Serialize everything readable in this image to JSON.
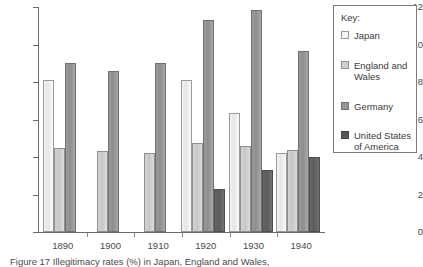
{
  "chart_data": {
    "type": "bar",
    "title": "",
    "xlabel": "",
    "ylabel": "",
    "ylim": [
      0,
      12
    ],
    "ytick_labels": [
      "0",
      "2",
      "4",
      "6",
      "8",
      "10",
      "12"
    ],
    "yticks": [
      0,
      2,
      4,
      6,
      8,
      10,
      12
    ],
    "grid": false,
    "legend_position": "right",
    "categories": [
      "1890",
      "1900",
      "1910",
      "1920",
      "1930",
      "1940"
    ],
    "series": [
      {
        "name": "Japan",
        "color": "#f2f2f2",
        "values": [
          8.1,
          null,
          null,
          8.1,
          6.35,
          4.2
        ]
      },
      {
        "name": "England and Wales",
        "color": "#d0d0d0",
        "values": [
          4.5,
          4.3,
          4.2,
          4.75,
          4.6,
          4.4
        ]
      },
      {
        "name": "Germany",
        "color": "#969696",
        "values": [
          9.0,
          8.6,
          9.0,
          11.3,
          11.85,
          9.65
        ]
      },
      {
        "name": "United States of America",
        "color": "#565656",
        "values": [
          null,
          null,
          null,
          2.3,
          3.3,
          4.0
        ]
      }
    ]
  },
  "legend": {
    "title": "Key:",
    "items": [
      {
        "label": "Japan"
      },
      {
        "label": "England and\nWales"
      },
      {
        "label": "Germany"
      },
      {
        "label": "United States\nof America"
      }
    ]
  },
  "caption": {
    "text": "Figure 17  Illegitimacy rates (%) in Japan, England and Wales,"
  }
}
